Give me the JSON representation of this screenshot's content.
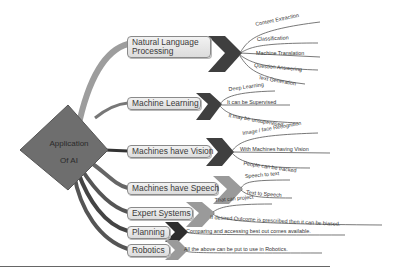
{
  "diagram": {
    "type": "mind-map",
    "center": {
      "line1": "Application",
      "line2": "Of AI"
    },
    "branches": [
      {
        "label": "Natural Language Processing",
        "line1": "Natural Language",
        "line2": "Processing",
        "leaves": [
          "Content Extraction",
          "Classification",
          "Machine Translation",
          "Question Answering",
          "Text Generation"
        ]
      },
      {
        "label": "Machine Learning",
        "leaves": [
          "Deep Learning",
          "It can be Supervised",
          "It may be unsupervised"
        ]
      },
      {
        "label": "Machines have Vision",
        "leaves": [
          "Image / face Recognition",
          "With Machines having Vision",
          "People can be tracked"
        ]
      },
      {
        "label": "Machines have Speech",
        "leaves": [
          "Speech to text",
          "Text to Speech"
        ]
      },
      {
        "label": "Expert Systems",
        "leaves": [
          "That can project",
          "If desired Outcome is prescribed then it can be biased."
        ]
      },
      {
        "label": "Planning",
        "leaves": [
          "Comparing and accessing best out comes available."
        ]
      },
      {
        "label": "Robotics",
        "leaves": [
          "All the above can be put to use in Robotics."
        ]
      }
    ],
    "colors": {
      "background": "#ffffff",
      "center_diamond": "#6e6e6e",
      "chevron_dark": "#3f3f3f",
      "chevron_light": "#9a9a9a",
      "node_fill": "#e6e6e6",
      "node_border": "#8a8a8a",
      "branch_line": "#555555"
    }
  }
}
